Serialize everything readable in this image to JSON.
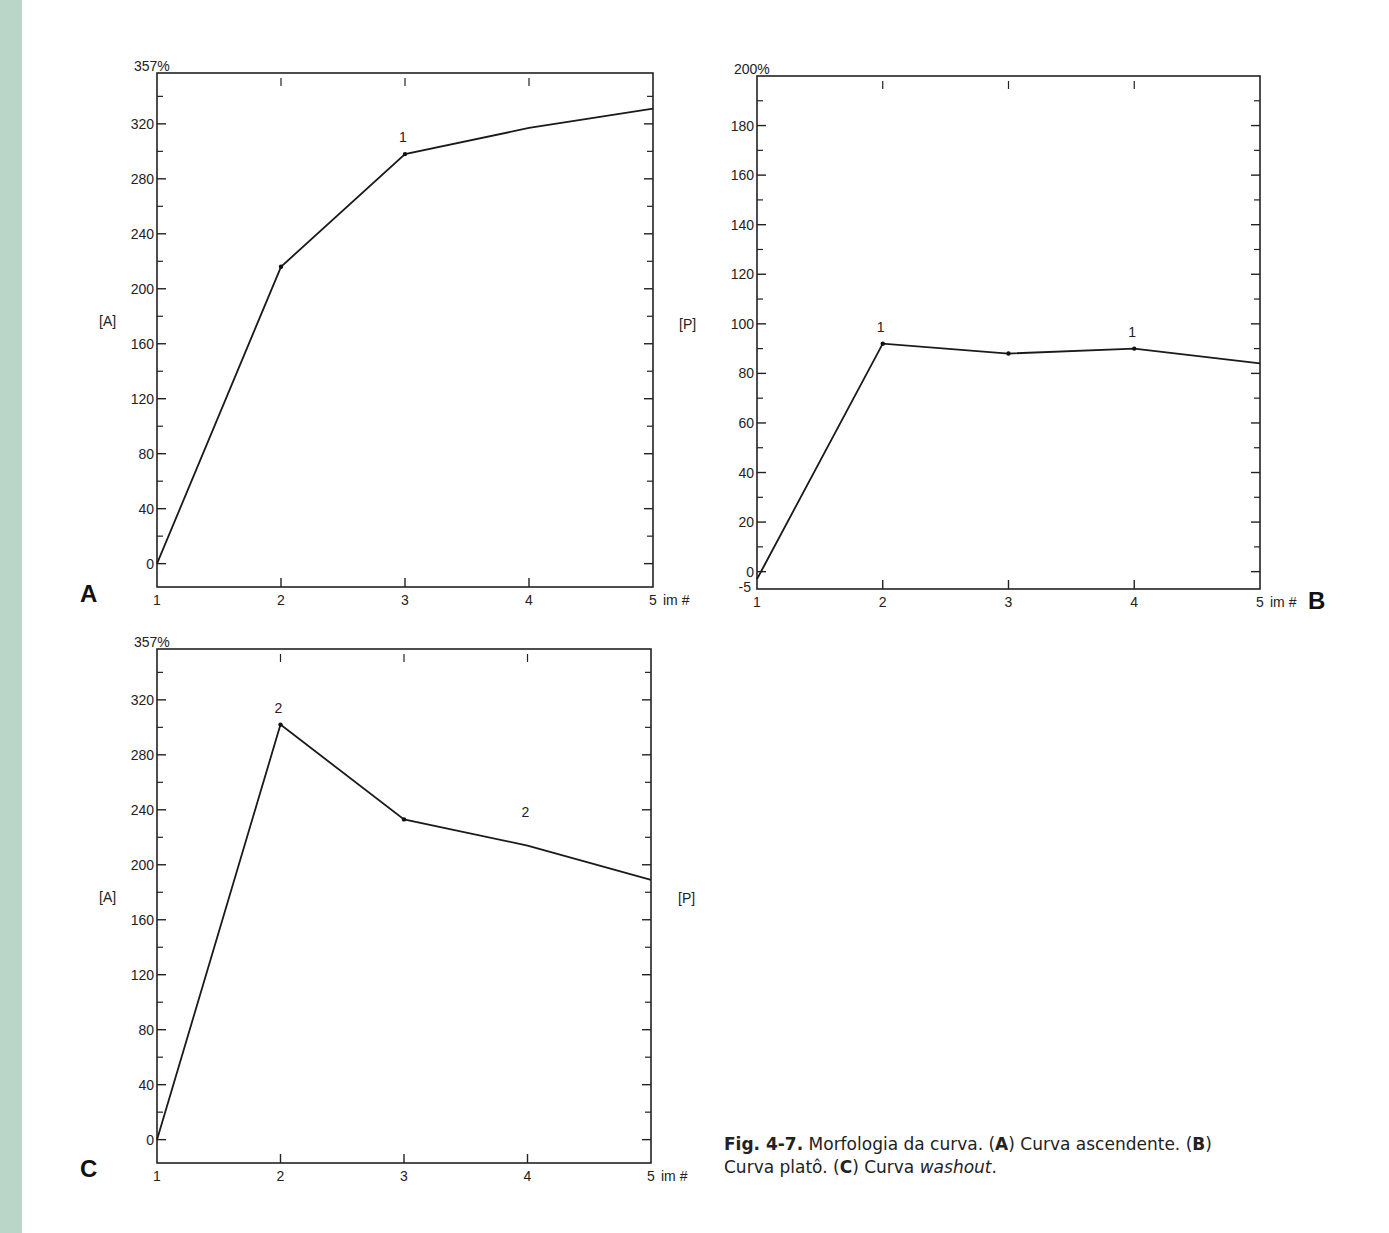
{
  "figure": {
    "caption": {
      "fig_label": "Fig. 4-7.",
      "text_1": " Morfologia da curva. (",
      "a": "A",
      "text_2": ") Curva ascendente. (",
      "b": "B",
      "text_3": ") Curva platô. (",
      "c": "C",
      "text_4": ") Curva ",
      "washout": "washout",
      "text_5": "."
    },
    "panels": [
      "A",
      "B",
      "C"
    ]
  },
  "chart_data": [
    {
      "type": "line",
      "panel": "A",
      "title": "Curva ascendente",
      "xlabel": "im #",
      "ylabel": "[A]",
      "ymax_label": "357%",
      "x": [
        1,
        2,
        3,
        4,
        5
      ],
      "x_ticks": [
        "1",
        "2",
        "3",
        "4",
        "5"
      ],
      "series": [
        {
          "name": "[A]",
          "values": [
            0,
            216,
            298,
            317,
            331
          ]
        }
      ],
      "point_markers": [
        1,
        2
      ],
      "annotations": [
        {
          "x": 3,
          "text": "1"
        }
      ],
      "y_ticks": [
        0,
        40,
        80,
        120,
        160,
        200,
        240,
        280,
        320
      ],
      "ylim": [
        -17,
        357
      ],
      "grid": false
    },
    {
      "type": "line",
      "panel": "B",
      "title": "Curva platô",
      "xlabel": "im #",
      "ylabel": "[P]",
      "ymax_label": "200%",
      "x": [
        1,
        2,
        3,
        4,
        5
      ],
      "x_ticks": [
        "1",
        "2",
        "3",
        "4",
        "5"
      ],
      "series": [
        {
          "name": "[P]",
          "values": [
            -3,
            92,
            88,
            90,
            84
          ]
        }
      ],
      "point_markers": [
        1,
        2,
        3
      ],
      "annotations": [
        {
          "x": 2,
          "text": "1"
        },
        {
          "x": 4,
          "text": "1"
        }
      ],
      "y_ticks": [
        -5,
        0,
        20,
        40,
        60,
        80,
        100,
        120,
        140,
        160,
        180
      ],
      "ylim": [
        -7,
        200
      ],
      "grid": false
    },
    {
      "type": "line",
      "panel": "C",
      "title": "Curva washout",
      "xlabel": "im #",
      "ylabel_left": "[A]",
      "ylabel_right": "[P]",
      "ymax_label": "357%",
      "x": [
        1,
        2,
        3,
        4,
        5
      ],
      "x_ticks": [
        "1",
        "2",
        "3",
        "4",
        "5"
      ],
      "series": [
        {
          "name": "[A]",
          "values": [
            0,
            302,
            233,
            214,
            189
          ]
        }
      ],
      "point_markers": [
        1,
        2
      ],
      "annotations": [
        {
          "x": 2,
          "text": "2"
        },
        {
          "x": 4,
          "text": "2",
          "y": 226
        }
      ],
      "y_ticks": [
        0,
        40,
        80,
        120,
        160,
        200,
        240,
        280,
        320
      ],
      "ylim": [
        -17,
        357
      ],
      "grid": false
    }
  ],
  "labels": {
    "ylabel_a": "[A]",
    "ylabel_p": "[P]",
    "im": "im #"
  }
}
